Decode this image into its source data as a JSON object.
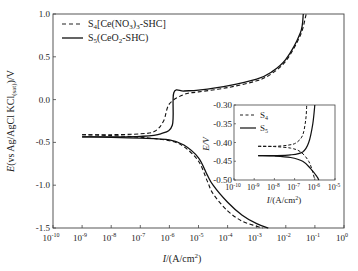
{
  "chart_data": [
    {
      "type": "line",
      "title": "",
      "xlabel": "I/(A/cm²)",
      "ylabel": "E(vs Ag/AgCl KCl(sat))/V",
      "xscale": "log",
      "xlim": [
        1e-10,
        1
      ],
      "ylim": [
        -1.5,
        1.0
      ],
      "x_ticks": [
        "10^-10",
        "10^-9",
        "10^-8",
        "10^-7",
        "10^-6",
        "10^-5",
        "10^-4",
        "10^-3",
        "10^-2",
        "10^-1",
        "10^0"
      ],
      "y_ticks": [
        "1.0",
        "0.5",
        "0.0",
        "-0.5",
        "-1.0",
        "-1.5"
      ],
      "legend_position": "upper left",
      "series": [
        {
          "name": "S4[Ce(NO3)3-SHC]",
          "style": "dashed",
          "anodic": {
            "logI": [
              -9,
              -8,
              -7,
              -6.5,
              -6.2,
              -6,
              -5.5,
              -5,
              -4,
              -3,
              -2.5,
              -2,
              -1.5,
              -1.3
            ],
            "E": [
              -0.41,
              -0.41,
              -0.4,
              -0.37,
              -0.25,
              -0.05,
              0.06,
              0.09,
              0.14,
              0.22,
              0.3,
              0.45,
              0.75,
              1.0
            ]
          },
          "cathodic": {
            "logI": [
              -9,
              -8,
              -7,
              -6,
              -5.5,
              -5,
              -4.7,
              -4.5,
              -4,
              -3.5,
              -3,
              -2.8
            ],
            "E": [
              -0.41,
              -0.42,
              -0.44,
              -0.48,
              -0.55,
              -0.72,
              -0.95,
              -1.1,
              -1.3,
              -1.42,
              -1.48,
              -1.5
            ]
          },
          "Ecorr": -0.41
        },
        {
          "name": "S5(CeO2-SHC)",
          "style": "solid",
          "anodic": {
            "logI": [
              -9,
              -8,
              -7,
              -6.3,
              -5.9,
              -5.85,
              -5.5,
              -5,
              -4,
              -3,
              -2.5,
              -2,
              -1.5,
              -1.4
            ],
            "E": [
              -0.435,
              -0.435,
              -0.43,
              -0.4,
              -0.3,
              0.08,
              0.1,
              0.11,
              0.16,
              0.24,
              0.32,
              0.47,
              0.78,
              1.0
            ]
          },
          "cathodic": {
            "logI": [
              -9,
              -8,
              -7,
              -6,
              -5.5,
              -5,
              -4.7,
              -4.5,
              -4,
              -3.5,
              -3,
              -2.6
            ],
            "E": [
              -0.435,
              -0.44,
              -0.45,
              -0.47,
              -0.53,
              -0.68,
              -0.88,
              -1.0,
              -1.2,
              -1.35,
              -1.45,
              -1.5
            ]
          },
          "Ecorr": -0.435
        }
      ]
    },
    {
      "type": "line",
      "title": "inset",
      "xlabel": "I/(A/cm²)",
      "ylabel": "E/V",
      "xscale": "log",
      "xlim": [
        1e-10,
        1e-05
      ],
      "ylim": [
        -0.5,
        -0.3
      ],
      "x_ticks": [
        "10^-10",
        "10^-9",
        "10^-8",
        "10^-7",
        "10^-6",
        "10^-5"
      ],
      "y_ticks": [
        "-0.30",
        "-0.35",
        "-0.40",
        "-0.45",
        "-0.50"
      ],
      "legend": [
        "S4",
        "S5"
      ],
      "series": [
        {
          "name": "S4",
          "style": "dashed",
          "Ecorr": -0.41
        },
        {
          "name": "S5",
          "style": "solid",
          "Ecorr": -0.435
        }
      ]
    }
  ],
  "main": {
    "xlabel_prefix": "I",
    "xlabel_rest": "/(A/cm",
    "ylabel_E": "E",
    "ylabel_mid": "(vs Ag/AgCl KCl",
    "ylabel_sub": "(sat)",
    "ylabel_end": ")/V",
    "legend": [
      {
        "pre": "S",
        "sub": "4",
        "post": "[Ce(NO",
        "sub2": "3",
        "post2": ")",
        "sub3": "3",
        "post3": "-SHC]"
      },
      {
        "pre": "S",
        "sub": "5",
        "post": "(CeO",
        "sub2": "2",
        "post2": "-SHC)"
      }
    ]
  },
  "inset": {
    "ylabel": "E/V",
    "legend": [
      {
        "pre": "S",
        "sub": "4"
      },
      {
        "pre": "S",
        "sub": "5"
      }
    ]
  }
}
